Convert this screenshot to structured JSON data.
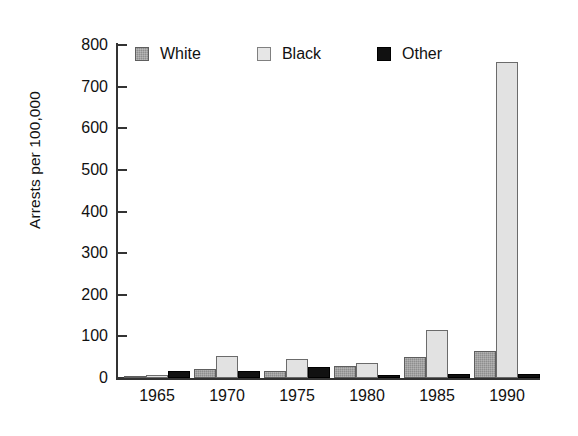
{
  "chart_data": {
    "type": "bar",
    "title": "",
    "subtitle": "",
    "xlabel": "",
    "ylabel": "Arrests per 100,000",
    "categories": [
      "1965",
      "1970",
      "1975",
      "1980",
      "1985",
      "1990"
    ],
    "series": [
      {
        "name": "White",
        "color": "#8e8e8e",
        "values": [
          5,
          22,
          17,
          28,
          50,
          65
        ]
      },
      {
        "name": "Black",
        "color": "#e2e2e2",
        "values": [
          8,
          52,
          46,
          35,
          115,
          760
        ]
      },
      {
        "name": "Other",
        "color": "#111111",
        "values": [
          16,
          18,
          26,
          8,
          10,
          10
        ]
      }
    ],
    "ylim": [
      0,
      800
    ],
    "yticks": [
      0,
      100,
      200,
      300,
      400,
      500,
      600,
      700,
      800
    ],
    "ytick_labels": [
      "0",
      "100",
      "200",
      "300",
      "400",
      "500",
      "600",
      "700",
      "800"
    ],
    "grid": false,
    "legend_position": "top-left-inside",
    "legend_entries": [
      "White",
      "Black",
      "Other"
    ]
  },
  "axes": {
    "y_title": "Arrests per 100,000"
  },
  "legend": {
    "items": [
      {
        "label": "White"
      },
      {
        "label": "Black"
      },
      {
        "label": "Other"
      }
    ]
  }
}
